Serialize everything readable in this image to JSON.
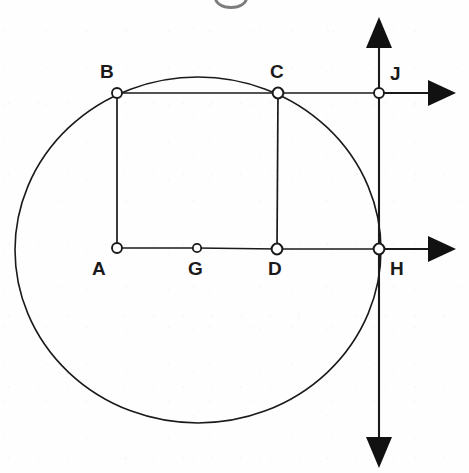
{
  "figure": {
    "kind": "geometry-diagram",
    "title_fragment": "",
    "background_color": "#fefefe",
    "stroke_color": "#1a1a1a",
    "label_color": "#1a1a1a",
    "marker_fill": "#ffffff",
    "canvas": {
      "width": 469,
      "height": 473
    }
  },
  "circle": {
    "name": "circle-through-A-B-C-H",
    "center": {
      "x": 198,
      "y": 250
    },
    "rx": 183,
    "ry": 173,
    "stroke_width": 1.6
  },
  "points": [
    {
      "id": "B",
      "label": "B",
      "x": 117,
      "y": 93,
      "marker_r": 5.0,
      "label_x": 100,
      "label_y": 62,
      "label_pos": "above-left"
    },
    {
      "id": "C",
      "label": "C",
      "x": 278,
      "y": 93,
      "marker_r": 5.4,
      "label_x": 270,
      "label_y": 62,
      "label_pos": "above"
    },
    {
      "id": "J",
      "label": "J",
      "x": 379,
      "y": 93,
      "marker_r": 5.0,
      "label_x": 390,
      "label_y": 64,
      "label_pos": "above-right"
    },
    {
      "id": "A",
      "label": "A",
      "x": 117,
      "y": 248,
      "marker_r": 5.0,
      "label_x": 92,
      "label_y": 259,
      "label_pos": "below-left"
    },
    {
      "id": "G",
      "label": "G",
      "x": 197,
      "y": 248,
      "marker_r": 4.2,
      "label_x": 188,
      "label_y": 259,
      "label_pos": "below"
    },
    {
      "id": "D",
      "label": "D",
      "x": 277,
      "y": 249,
      "marker_r": 5.4,
      "label_x": 268,
      "label_y": 259,
      "label_pos": "below"
    },
    {
      "id": "H",
      "label": "H",
      "x": 379,
      "y": 249,
      "marker_r": 5.4,
      "label_x": 390,
      "label_y": 259,
      "label_pos": "below-right"
    }
  ],
  "segments": [
    {
      "name": "segment-B-C",
      "from": "B",
      "to": "C",
      "x1": 117,
      "y1": 93,
      "x2": 278,
      "y2": 93
    },
    {
      "name": "segment-C-J",
      "from": "C",
      "to": "J",
      "x1": 278,
      "y1": 93,
      "x2": 379,
      "y2": 93
    },
    {
      "name": "segment-A-B",
      "from": "A",
      "to": "B",
      "x1": 117,
      "y1": 248,
      "x2": 117,
      "y2": 93
    },
    {
      "name": "segment-C-D",
      "from": "C",
      "to": "D",
      "x1": 278,
      "y1": 93,
      "x2": 277,
      "y2": 249
    },
    {
      "name": "segment-A-G",
      "from": "A",
      "to": "G",
      "x1": 117,
      "y1": 248,
      "x2": 197,
      "y2": 248
    },
    {
      "name": "segment-G-D",
      "from": "G",
      "to": "D",
      "x1": 197,
      "y1": 248,
      "x2": 277,
      "y2": 249
    },
    {
      "name": "segment-D-H",
      "from": "D",
      "to": "H",
      "x1": 277,
      "y1": 249,
      "x2": 379,
      "y2": 249
    }
  ],
  "axes": [
    {
      "name": "vertical-axis",
      "orientation": "vertical",
      "x": 379,
      "y_from": 17,
      "y_to": 468,
      "arrowheads": [
        "up",
        "down"
      ]
    },
    {
      "name": "horizontal-ray-through-J",
      "orientation": "horizontal",
      "y": 93,
      "x_from": 379,
      "x_to": 455,
      "arrowheads": [
        "right"
      ]
    },
    {
      "name": "horizontal-ray-through-H",
      "orientation": "horizontal",
      "y": 249,
      "x_from": 379,
      "x_to": 455,
      "arrowheads": [
        "right"
      ]
    }
  ],
  "arrowheads": [
    {
      "name": "arrowhead-up",
      "tip_x": 379,
      "tip_y": 17,
      "direction": "up"
    },
    {
      "name": "arrowhead-down",
      "tip_x": 379,
      "tip_y": 468,
      "direction": "down"
    },
    {
      "name": "arrowhead-right-upper",
      "tip_x": 456,
      "tip_y": 93,
      "direction": "right"
    },
    {
      "name": "arrowhead-right-lower",
      "tip_x": 456,
      "tip_y": 249,
      "direction": "right"
    }
  ]
}
